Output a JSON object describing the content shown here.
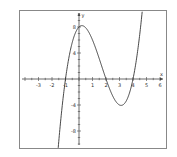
{
  "chart_data": {
    "type": "line",
    "title": "",
    "xlabel": "x",
    "ylabel": "y",
    "xlim": [
      -3.5,
      6
    ],
    "ylim": [
      -11,
      10.5
    ],
    "x_ticks": [
      -3,
      -2,
      -1,
      1,
      2,
      3,
      4,
      5,
      6
    ],
    "x_tick_labels": [
      "-3",
      "-2",
      "-1",
      "1",
      "2",
      "3",
      "4",
      "5",
      "6"
    ],
    "y_ticks": [
      8,
      4,
      -4,
      -8
    ],
    "y_tick_labels": [
      "8",
      "4",
      "-4",
      "-8"
    ],
    "grid": false,
    "legend": null,
    "series": [
      {
        "name": "cubic",
        "expression": "(x+1)(x-2)(x-4)",
        "zeros": [
          -1,
          2,
          4
        ],
        "y_intercept": 8,
        "local_max": {
          "x": 0.21,
          "y": 8.21
        },
        "local_min": {
          "x": 3.12,
          "y": -4.06
        },
        "x": [
          -1.8,
          -1.5,
          -1,
          -0.5,
          0,
          0.5,
          1,
          1.5,
          2,
          2.5,
          3,
          3.5,
          4,
          4.5,
          5,
          5.5
        ],
        "y": [
          -11.5,
          -4.9,
          0,
          5.6,
          8,
          7.9,
          6,
          3.1,
          0,
          -2.6,
          -4,
          -3.4,
          0,
          6.9,
          18,
          32.1
        ]
      }
    ]
  },
  "axes": {
    "x_label": "x",
    "y_label": "y"
  },
  "colors": {
    "curve": "#333333",
    "axis": "#444444",
    "frame": "#888888",
    "background": "#ffffff"
  }
}
